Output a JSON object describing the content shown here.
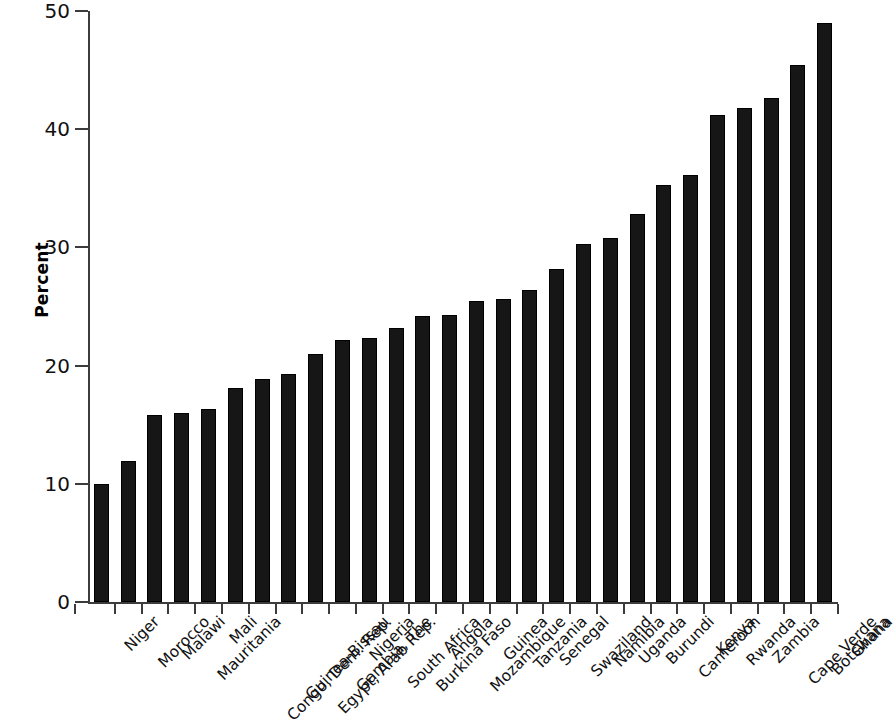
{
  "chart_data": {
    "type": "bar",
    "title": "",
    "xlabel": "",
    "ylabel": "Percent",
    "ylim": [
      0,
      50
    ],
    "ytick_values": [
      0,
      10,
      20,
      30,
      40,
      50
    ],
    "ytick_labels": [
      "0",
      "10",
      "20",
      "30",
      "40",
      "50"
    ],
    "grid": false,
    "legend": null,
    "bar_color": "#161616",
    "axis_color": "#3c3c3c",
    "categories": [
      "Niger",
      "Morocco",
      "Malawi",
      "Mauritania",
      "Mali",
      "Congo, Dem. Rep.",
      "Guinea-Bissau",
      "Egypt, Arab Rep.",
      "Gambia, The",
      "Nigeria",
      "South Africa",
      "Burkina Faso",
      "Angola",
      "Mozambique",
      "Guinea",
      "Tanzania",
      "Senegal",
      "Swaziland",
      "Namibia",
      "Uganda",
      "Burundi",
      "Cameroon",
      "Kenya",
      "Rwanda",
      "Zambia",
      "Cape Verde",
      "Botswana",
      "Ghana"
    ],
    "values": [
      10.0,
      11.9,
      15.8,
      16.0,
      16.3,
      18.1,
      18.9,
      19.3,
      21.0,
      22.2,
      22.3,
      23.2,
      24.2,
      24.3,
      25.5,
      25.6,
      26.4,
      28.2,
      30.3,
      30.8,
      32.8,
      35.3,
      36.1,
      41.2,
      41.8,
      42.6,
      45.4,
      49.0
    ]
  }
}
